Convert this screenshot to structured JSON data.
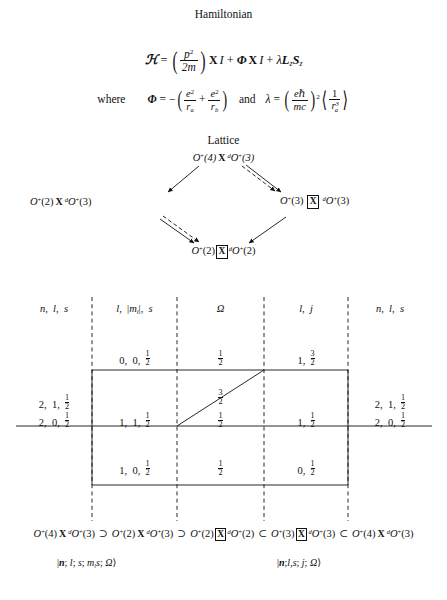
{
  "document": {
    "title": "Hamiltonian and Lattice figure",
    "sections": {
      "hamiltonian_heading": "Hamiltonian",
      "lattice_heading": "Lattice"
    }
  },
  "equations": {
    "hamiltonian": {
      "lhs": "ℋ",
      "eq": "=",
      "kinetic_num": "p",
      "kinetic_num_sup": "2",
      "kinetic_den": "2m",
      "cross1": "X",
      "identity1": "I",
      "plus1": "+",
      "phi": "Φ",
      "cross2": "X",
      "identity2": "I",
      "plus2": "+",
      "lambda": "λ",
      "L": "L",
      "L_sub": "z",
      "S": "S",
      "S_sub": "z"
    },
    "definitions": {
      "where_label": "where",
      "phi_symbol": "Φ",
      "phi_eq": "=",
      "phi_minus": "−",
      "t1_num": "e",
      "t1_num_sup": "2",
      "t1_den": "r",
      "t1_den_sub": "a",
      "phi_plus": "+",
      "t2_num": "e",
      "t2_num_sup": "2",
      "t2_den": "r",
      "t2_den_sub": "b",
      "and_label": "and",
      "lambda_symbol": "λ",
      "lambda_eq": "=",
      "l1_num": "eℏ",
      "l1_den": "mc",
      "l_exp": "2",
      "avg_num": "1",
      "avg_den": "r",
      "avg_den_sub": "a",
      "avg_den_sup": "3"
    }
  },
  "lattice": {
    "nodes": [
      {
        "id": "top",
        "parts": [
          "O",
          "+",
          "(4)",
          "X",
          "d",
          "O",
          "+",
          "(3)"
        ],
        "text": "O⁺(4) X ᵈO⁺(3)",
        "boxed": false
      },
      {
        "id": "left",
        "text": "O⁺(2) X ᵈO⁺(3)",
        "boxed": false
      },
      {
        "id": "right",
        "text": "O⁺(3) ⊠ ᵈO⁺(3)",
        "boxed": true
      },
      {
        "id": "bottom",
        "text": "O⁺(2) ⊠ ᵈO⁺(2)",
        "boxed": true
      }
    ],
    "edges": [
      {
        "from": "top",
        "to": "left",
        "style": "solid"
      },
      {
        "from": "top",
        "to": "right",
        "style": "dashed"
      },
      {
        "from": "top",
        "to": "right",
        "style": "solid"
      },
      {
        "from": "left",
        "to": "bottom",
        "style": "dashed"
      },
      {
        "from": "left",
        "to": "bottom",
        "style": "solid"
      },
      {
        "from": "right",
        "to": "bottom",
        "style": "solid"
      }
    ]
  },
  "table": {
    "headers": [
      {
        "id": "col1",
        "text": "n,  l,  s"
      },
      {
        "id": "col2",
        "text": "l,  |mₗ|,  s"
      },
      {
        "id": "col3",
        "text": "Ω"
      },
      {
        "id": "col4",
        "text": "l,  j"
      },
      {
        "id": "col5",
        "text": "n,  l,  s"
      }
    ],
    "rows": {
      "top_row": {
        "col2": "0,  0,  ½",
        "col3": "½",
        "col4": "1,  3⁄2"
      },
      "middle_row": {
        "col1_line1": "2,  1,  ½",
        "col1_line2": "2,  0,  ½",
        "col2": "1,  1,  ½",
        "col3_upper": "3⁄2",
        "col3_lower": "½",
        "col4": "1,  ½",
        "col5_line1": "2,  1,  ½",
        "col5_line2": "2,  0,  ½"
      },
      "bottom_row": {
        "col2": "1,  0,  ½",
        "col3": "½",
        "col4": "0,  ½"
      }
    }
  },
  "chain": {
    "items": [
      {
        "text": "O⁺(4) X ᵈO⁺(3)",
        "boxed": false
      },
      {
        "relation": "⊃"
      },
      {
        "text": "O⁺(2) X ᵈO⁺(3)",
        "boxed": false
      },
      {
        "relation": "⊃"
      },
      {
        "text": "O⁺(2) ⊠ ᵈO⁺(2)",
        "boxed": true
      },
      {
        "relation": "⊂"
      },
      {
        "text": "O⁺(3) ⊠ ᵈO⁺(3)",
        "boxed": true
      },
      {
        "relation": "⊂"
      },
      {
        "text": "O⁺(4) X ᵈO⁺(3)",
        "boxed": false
      }
    ],
    "relations": [
      "⊃",
      "⊃",
      "⊂",
      "⊂"
    ]
  },
  "kets": {
    "left": "|n; l; s; mₗs; Ω⟩",
    "right": "|n; l,s; j; Ω⟩"
  },
  "colors": {
    "ink": "#111111",
    "background": "#ffffff",
    "rule": "#1a1a1a"
  }
}
